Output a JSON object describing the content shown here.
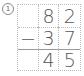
{
  "problem_number": "1",
  "rows": [
    {
      "cells": [
        "",
        "8",
        "2"
      ]
    },
    {
      "cells": [
        "−",
        "3",
        "7"
      ]
    },
    {
      "cells": [
        "",
        "4",
        "5"
      ]
    }
  ]
}
